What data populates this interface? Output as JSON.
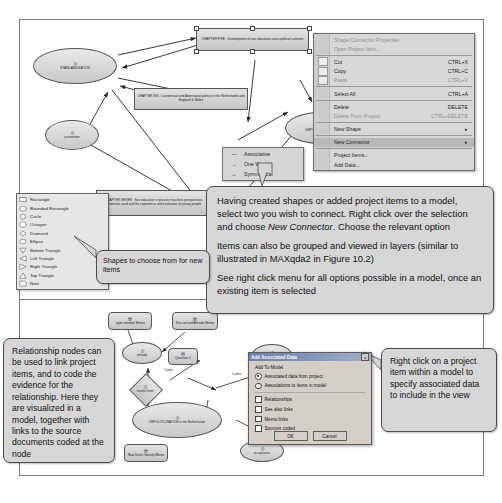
{
  "model_top": {
    "nodes": [
      {
        "id": "standardisation",
        "label": "STANDARDISATION",
        "icon": "node-icon"
      },
      {
        "id": "prevention",
        "label": "prevention",
        "icon": "node-icon"
      },
      {
        "id": "depoliticisation",
        "label": "DEPOLITICISATION",
        "icon": "node-icon"
      },
      {
        "id": "chapter_five",
        "label": "CHAPTER FIVE : Development of sex education socio-political contexts"
      },
      {
        "id": "chapter_six",
        "label": "CHAPTER SIX : Consensual and Adversarial politics in the Netherlands and England & Wales"
      },
      {
        "id": "chapter_seven",
        "label": "CHAPTER SEVEN : Sex education in practice teachers perspectives, materials used and the experience and evaluation of young people"
      }
    ]
  },
  "model_bottom": {
    "nodes": [
      {
        "id": "open_minded_memo",
        "label": "'open minded' Memo"
      },
      {
        "id": "sexual_attitude_memo",
        "label": "Sex-ual and Attitude Memo"
      },
      {
        "id": "attitude",
        "label": "attitude"
      },
      {
        "id": "autonomy",
        "label": "autonomy"
      },
      {
        "id": "question_c",
        "label": "Question C"
      },
      {
        "id": "results_from",
        "label": "results from"
      },
      {
        "id": "relates_to_1",
        "label": "relates to"
      },
      {
        "id": "relates_to_2",
        "label": "relates to"
      },
      {
        "id": "depoliticisation_nl",
        "label": "DEPOLITICISATION in the Netherlands"
      },
      {
        "id": "free_vision",
        "label": "Free Vision"
      },
      {
        "id": "acceptance",
        "label": "acceptance"
      },
      {
        "id": "new_dutch_society_memo",
        "label": "New Dutch Society Memo"
      }
    ],
    "edge_labels": [
      "Codes",
      "Codes",
      "Codes",
      "Codes"
    ]
  },
  "context_menu": {
    "items": [
      {
        "label": "Shape/Connector Properties",
        "accel": "",
        "disabled": true,
        "submenu": false
      },
      {
        "label": "Open Project Item...",
        "accel": "",
        "disabled": true,
        "submenu": false
      },
      {
        "sep": true
      },
      {
        "label": "Cut",
        "accel": "CTRL+X",
        "disabled": false,
        "submenu": false,
        "icon": "cut-icon"
      },
      {
        "label": "Copy",
        "accel": "CTRL+C",
        "disabled": false,
        "submenu": false,
        "icon": "copy-icon"
      },
      {
        "label": "Paste",
        "accel": "CTRL+V",
        "disabled": true,
        "submenu": false,
        "icon": "paste-icon"
      },
      {
        "sep": true
      },
      {
        "label": "Select All",
        "accel": "CTRL+A",
        "disabled": false,
        "submenu": false
      },
      {
        "sep": true
      },
      {
        "label": "Delete",
        "accel": "DELETE",
        "disabled": false,
        "submenu": false
      },
      {
        "label": "Delete From Project",
        "accel": "CTRL+DELETE",
        "disabled": true,
        "submenu": false
      },
      {
        "sep": true
      },
      {
        "label": "New Shape",
        "accel": "",
        "disabled": false,
        "submenu": true
      },
      {
        "label": "New Connector",
        "accel": "",
        "disabled": false,
        "submenu": true,
        "highlighted": true
      },
      {
        "label": "Project Items...",
        "accel": "",
        "disabled": false,
        "submenu": false
      },
      {
        "label": "Add Data...",
        "accel": "",
        "disabled": false,
        "submenu": false
      }
    ]
  },
  "connector_submenu": {
    "items": [
      {
        "label": "Associative",
        "glyph": "—"
      },
      {
        "label": "One Way",
        "glyph": "→"
      },
      {
        "label": "Symmetrical",
        "glyph": "↔"
      }
    ]
  },
  "shape_palette": {
    "items": [
      {
        "label": "Rectangle",
        "shape": "rectangle"
      },
      {
        "label": "Rounded Rectangle",
        "shape": "rounded-rectangle"
      },
      {
        "label": "Circle",
        "shape": "circle"
      },
      {
        "label": "Octagon",
        "shape": "octagon"
      },
      {
        "label": "Diamond",
        "shape": "diamond"
      },
      {
        "label": "Ellipse",
        "shape": "ellipse"
      },
      {
        "label": "Bottom Triangle",
        "shape": "bottom-triangle"
      },
      {
        "label": "Left Triangle",
        "shape": "left-triangle"
      },
      {
        "label": "Right Triangle",
        "shape": "right-triangle"
      },
      {
        "label": "Top Triangle",
        "shape": "top-triangle"
      },
      {
        "label": "Note",
        "shape": "note"
      }
    ]
  },
  "callouts": {
    "connector": {
      "p1_a": "Having created shapes or added project items to a model, select two you wish to connect. Right click over the selection and choose ",
      "p1_em": "New Connector",
      "p1_b": ". Choose the relevant option",
      "p2": "Items can also be grouped and viewed in layers (similar to illustrated in MAXqda2 in Figure 10.2)",
      "p3": "See right click menu for all options possible in a model, once an existing item is selected"
    },
    "shapes": {
      "text": "Shapes to choose from for new items"
    },
    "relationship": {
      "text": "Relationship nodes can be used to link project items, and to code the evidence for the relationship. Here they are visualized in a model, together with links to the source documents coded at the node"
    },
    "rightclick": {
      "text": "Right click on a project item within a model to specify associated data to include in the view"
    }
  },
  "dialog": {
    "title": "Add Associated Data",
    "close_label": "x",
    "group_label": "Add To Model",
    "radios": [
      {
        "label": "Associated data from project",
        "selected": true
      },
      {
        "label": "Associations to items in model",
        "selected": false
      }
    ],
    "checkboxes": [
      {
        "label": "Relationships",
        "checked": false
      },
      {
        "label": "See also links",
        "checked": false
      },
      {
        "label": "Memo links",
        "checked": false
      },
      {
        "label": "Sources coded",
        "checked": false
      }
    ],
    "buttons": [
      {
        "label": "OK"
      },
      {
        "label": "Cancel"
      }
    ]
  },
  "colors": {
    "shape_fill": "#d6d6d6",
    "callout_fill": "#d7d7d7",
    "dialog_title": "#6a7fa8",
    "menu_bg": "#d8d8d8"
  }
}
